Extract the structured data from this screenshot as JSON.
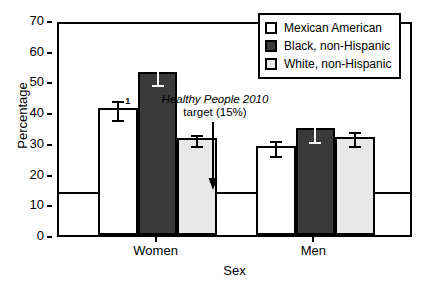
{
  "chart_data": {
    "type": "bar",
    "title": "",
    "xlabel": "Sex",
    "ylabel": "Percentage",
    "ylim": [
      0,
      70
    ],
    "yticks": [
      0,
      10,
      20,
      30,
      40,
      50,
      60,
      70
    ],
    "grid": false,
    "legend_position": "top-right",
    "categories": [
      "Women",
      "Men"
    ],
    "series": [
      {
        "name": "Mexican American",
        "fill": "white",
        "color": "#ffffff",
        "values": [
          41.5,
          29.0
        ],
        "errors_low": [
          38.0,
          26.5
        ],
        "errors_high": [
          45.0,
          32.0
        ]
      },
      {
        "name": "Black, non-Hispanic",
        "fill": "dark",
        "color": "#3a3a3a",
        "values": [
          53.0,
          35.0
        ],
        "errors_low": [
          49.5,
          31.0
        ],
        "errors_high": [
          57.0,
          39.5
        ]
      },
      {
        "name": "White, non-Hispanic",
        "fill": "light",
        "color": "#e8e8e8",
        "values": [
          31.5,
          32.0
        ],
        "errors_low": [
          29.5,
          29.5
        ],
        "errors_high": [
          34.0,
          35.0
        ]
      }
    ],
    "reference_line": {
      "value": 15,
      "label_line1": "Healthy People 2010",
      "label_line2": "target (15%)"
    },
    "annotations": [
      {
        "name": "footnote-marker",
        "text": "1",
        "attached_to": "Women / Mexican American"
      }
    ]
  },
  "axis": {
    "ylabel": "Percentage",
    "xlabel": "Sex",
    "yticks": [
      "0",
      "10",
      "20",
      "30",
      "40",
      "50",
      "60",
      "70"
    ],
    "group_labels": [
      "Women",
      "Men"
    ]
  },
  "legend": {
    "items": [
      {
        "label": "Mexican American"
      },
      {
        "label": "Black, non-Hispanic"
      },
      {
        "label": "White, non-Hispanic"
      }
    ]
  },
  "annotation": {
    "line1": "Healthy People 2010",
    "line2": "target (15%)",
    "arrow_icon": "arrow-down-icon"
  },
  "footnote": {
    "marker": "1"
  }
}
